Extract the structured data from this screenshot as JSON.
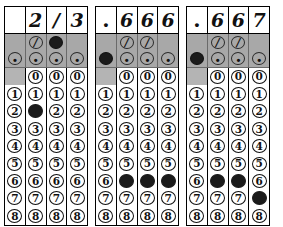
{
  "document": {
    "type": "grid-in-answer-sheet",
    "grid_count": 3
  },
  "symbols": {
    "fraction_bar": "/",
    "decimal_point": ".",
    "blank": ""
  },
  "digits": [
    "0",
    "1",
    "2",
    "3",
    "4",
    "5",
    "6",
    "7",
    "8"
  ],
  "colors": {
    "shade_band": "#a8a8a8",
    "shade_cell": "#b4b4b4",
    "ink": "#111111",
    "filled_bubble": "#1b1b1b",
    "paper": "#ffffff"
  },
  "grids": [
    {
      "name": "grid-1",
      "answer": "2/3",
      "written": [
        "",
        "2",
        "/",
        "3"
      ],
      "columns": [
        {
          "index": 1,
          "has_fraction_bubble": false,
          "has_decimal_bubble": true,
          "has_zero_bubble": false,
          "fraction_filled": false,
          "decimal_filled": false,
          "filled_digit": null
        },
        {
          "index": 2,
          "has_fraction_bubble": true,
          "has_decimal_bubble": true,
          "has_zero_bubble": true,
          "fraction_filled": false,
          "decimal_filled": false,
          "filled_digit": "2"
        },
        {
          "index": 3,
          "has_fraction_bubble": true,
          "has_decimal_bubble": true,
          "has_zero_bubble": true,
          "fraction_filled": true,
          "decimal_filled": false,
          "filled_digit": null
        },
        {
          "index": 4,
          "has_fraction_bubble": false,
          "has_decimal_bubble": true,
          "has_zero_bubble": true,
          "fraction_filled": false,
          "decimal_filled": false,
          "filled_digit": null
        }
      ]
    },
    {
      "name": "grid-2",
      "answer": ".666",
      "written": [
        ".",
        "6",
        "6",
        "6"
      ],
      "columns": [
        {
          "index": 1,
          "has_fraction_bubble": false,
          "has_decimal_bubble": true,
          "has_zero_bubble": false,
          "fraction_filled": false,
          "decimal_filled": true,
          "filled_digit": null
        },
        {
          "index": 2,
          "has_fraction_bubble": true,
          "has_decimal_bubble": true,
          "has_zero_bubble": true,
          "fraction_filled": false,
          "decimal_filled": false,
          "filled_digit": "6"
        },
        {
          "index": 3,
          "has_fraction_bubble": true,
          "has_decimal_bubble": true,
          "has_zero_bubble": true,
          "fraction_filled": false,
          "decimal_filled": false,
          "filled_digit": "6"
        },
        {
          "index": 4,
          "has_fraction_bubble": false,
          "has_decimal_bubble": true,
          "has_zero_bubble": true,
          "fraction_filled": false,
          "decimal_filled": false,
          "filled_digit": "6"
        }
      ]
    },
    {
      "name": "grid-3",
      "answer": ".667",
      "written": [
        ".",
        "6",
        "6",
        "7"
      ],
      "columns": [
        {
          "index": 1,
          "has_fraction_bubble": false,
          "has_decimal_bubble": true,
          "has_zero_bubble": false,
          "fraction_filled": false,
          "decimal_filled": true,
          "filled_digit": null
        },
        {
          "index": 2,
          "has_fraction_bubble": true,
          "has_decimal_bubble": true,
          "has_zero_bubble": true,
          "fraction_filled": false,
          "decimal_filled": false,
          "filled_digit": "6"
        },
        {
          "index": 3,
          "has_fraction_bubble": true,
          "has_decimal_bubble": true,
          "has_zero_bubble": true,
          "fraction_filled": false,
          "decimal_filled": false,
          "filled_digit": "6"
        },
        {
          "index": 4,
          "has_fraction_bubble": false,
          "has_decimal_bubble": true,
          "has_zero_bubble": true,
          "fraction_filled": false,
          "decimal_filled": false,
          "filled_digit": "7"
        }
      ]
    }
  ]
}
